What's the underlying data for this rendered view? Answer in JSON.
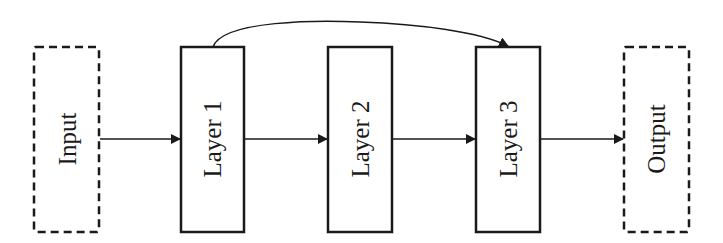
{
  "diagram": {
    "type": "flow",
    "nodes": [
      {
        "id": "input",
        "label": "Input",
        "style": "dashed"
      },
      {
        "id": "layer1",
        "label": "Layer 1",
        "style": "solid"
      },
      {
        "id": "layer2",
        "label": "Layer 2",
        "style": "solid"
      },
      {
        "id": "layer3",
        "label": "Layer 3",
        "style": "solid"
      },
      {
        "id": "output",
        "label": "Output",
        "style": "dashed"
      }
    ],
    "edges": [
      {
        "from": "input",
        "to": "layer1",
        "kind": "straight"
      },
      {
        "from": "layer1",
        "to": "layer2",
        "kind": "straight"
      },
      {
        "from": "layer2",
        "to": "layer3",
        "kind": "straight"
      },
      {
        "from": "layer3",
        "to": "output",
        "kind": "straight"
      },
      {
        "from": "layer1",
        "to": "layer3",
        "kind": "curved-skip"
      }
    ],
    "colors": {
      "stroke": "#1a1a1a",
      "background": "#ffffff"
    }
  }
}
